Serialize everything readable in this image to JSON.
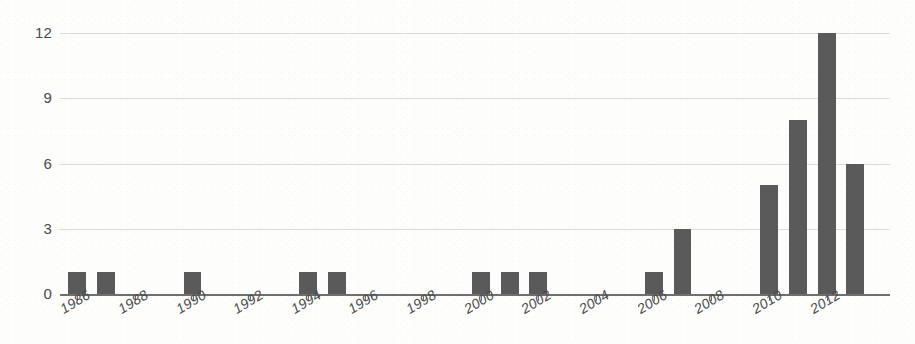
{
  "chart_data": {
    "type": "bar",
    "title": "",
    "subtitle": "",
    "xlabel": "",
    "ylabel": "",
    "categories": [
      1986,
      1987,
      1988,
      1989,
      1990,
      1991,
      1992,
      1993,
      1994,
      1995,
      1996,
      1997,
      1998,
      1999,
      2000,
      2001,
      2002,
      2003,
      2004,
      2005,
      2006,
      2007,
      2008,
      2009,
      2010,
      2011,
      2012,
      2013
    ],
    "values": [
      1,
      1,
      0,
      0,
      1,
      0,
      0,
      0,
      1,
      1,
      0,
      0,
      0,
      0,
      1,
      1,
      1,
      0,
      0,
      0,
      1,
      3,
      0,
      0,
      5,
      8,
      12,
      6
    ],
    "ylim": [
      0,
      12
    ],
    "y_ticks": [
      0,
      3,
      6,
      9,
      12
    ],
    "y_tick_labels": [
      "0",
      "3",
      "6",
      "9",
      "12"
    ],
    "x_tick_labels": [
      "1986",
      "1988",
      "1990",
      "1992",
      "1994",
      "1996",
      "1998",
      "2000",
      "2002",
      "2004",
      "2006",
      "2008",
      "2010",
      "2012"
    ],
    "x_tick_values": [
      1986,
      1988,
      1990,
      1992,
      1994,
      1996,
      1998,
      2000,
      2002,
      2004,
      2006,
      2008,
      2010,
      2012
    ],
    "grid": true,
    "legend": null,
    "legend_position": "none",
    "bar_color": "#5a5a5a",
    "gridline_color": "#cfcfcf",
    "axis_color": "#6f6f6f",
    "text_color": "#4a4a4a"
  }
}
